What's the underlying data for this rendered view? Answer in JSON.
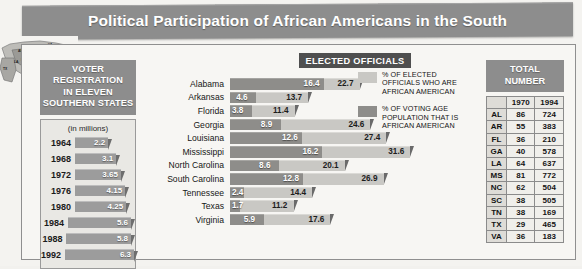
{
  "header": {
    "title": "Political Participation of African Americans in the South"
  },
  "map": {
    "name": "southern-states-map",
    "state_labels": [
      "TX",
      "AR",
      "LA",
      "MS",
      "AL",
      "TN",
      "GA",
      "FL",
      "SC",
      "NC",
      "VA"
    ]
  },
  "voter_registration": {
    "heading_lines": [
      "VOTER",
      "REGISTRATION",
      "IN ELEVEN",
      "SOUTHERN STATES"
    ],
    "subtitle": "(in millions)",
    "rows": [
      {
        "year": "1964",
        "value": "2.2",
        "num": 2.2
      },
      {
        "year": "1968",
        "value": "3.1",
        "num": 3.1
      },
      {
        "year": "1972",
        "value": "3.65",
        "num": 3.65
      },
      {
        "year": "1976",
        "value": "4.15",
        "num": 4.15
      },
      {
        "year": "1980",
        "value": "4.25",
        "num": 4.25
      },
      {
        "year": "1984",
        "value": "5.6",
        "num": 5.6
      },
      {
        "year": "1988",
        "value": "5.8",
        "num": 5.8
      },
      {
        "year": "1992",
        "value": "6.3",
        "num": 6.3
      }
    ]
  },
  "elected_officials": {
    "banner": "ELECTED OFFICIALS",
    "legend": [
      {
        "swatch": "light",
        "text": "% OF ELECTED OFFICIALS WHO ARE AFRICAN AMERICAN"
      },
      {
        "swatch": "dark",
        "text": "% OF VOTING AGE POPULATION THAT IS AFRICAN AMERICAN"
      }
    ]
  },
  "total_number": {
    "heading_lines": [
      "TOTAL",
      "NUMBER"
    ],
    "columns": [
      "",
      "1970",
      "1994"
    ],
    "rows": [
      {
        "state": "AL",
        "y1970": "86",
        "y1994": "724"
      },
      {
        "state": "AR",
        "y1970": "55",
        "y1994": "383"
      },
      {
        "state": "FL",
        "y1970": "36",
        "y1994": "210"
      },
      {
        "state": "GA",
        "y1970": "40",
        "y1994": "578"
      },
      {
        "state": "LA",
        "y1970": "64",
        "y1994": "637"
      },
      {
        "state": "MS",
        "y1970": "81",
        "y1994": "772"
      },
      {
        "state": "NC",
        "y1970": "62",
        "y1994": "504"
      },
      {
        "state": "SC",
        "y1970": "38",
        "y1994": "505"
      },
      {
        "state": "TN",
        "y1970": "38",
        "y1994": "169"
      },
      {
        "state": "TX",
        "y1970": "29",
        "y1994": "465"
      },
      {
        "state": "VA",
        "y1970": "36",
        "y1994": "183"
      }
    ]
  },
  "colors": {
    "banner_gray": "#8d8d8d",
    "bar_light": "#c9c8c4",
    "bar_dark": "#8e8d8a",
    "page_bg": "#f4f3f0",
    "text_dark": "#161616"
  },
  "chart_data": [
    {
      "type": "bar",
      "title": "ELECTED OFFICIALS",
      "orientation": "horizontal",
      "categories": [
        "Alabama",
        "Arkansas",
        "Florida",
        "Georgia",
        "Louisiana",
        "Mississippi",
        "North Carolina",
        "South Carolina",
        "Tennessee",
        "Texas",
        "Virginia"
      ],
      "series": [
        {
          "name": "% OF ELECTED OFFICIALS WHO ARE AFRICAN AMERICAN",
          "values": [
            16.4,
            4.6,
            3.8,
            8.9,
            12.6,
            16.2,
            8.6,
            12.8,
            2.4,
            1.7,
            5.9
          ]
        },
        {
          "name": "% OF VOTING AGE POPULATION THAT IS AFRICAN AMERICAN",
          "values": [
            22.7,
            13.7,
            11.4,
            24.6,
            27.4,
            31.6,
            20.1,
            26.9,
            14.4,
            11.2,
            17.6
          ]
        }
      ],
      "xlabel": "",
      "ylabel": "",
      "xlim": [
        0,
        34
      ],
      "grid": false,
      "legend_position": "right"
    },
    {
      "type": "bar",
      "title": "VOTER REGISTRATION IN ELEVEN SOUTHERN STATES",
      "subtitle": "(in millions)",
      "orientation": "horizontal",
      "categories": [
        "1964",
        "1968",
        "1972",
        "1976",
        "1980",
        "1984",
        "1988",
        "1992"
      ],
      "values": [
        2.2,
        3.1,
        3.65,
        4.15,
        4.25,
        5.6,
        5.8,
        6.3
      ],
      "xlabel": "millions",
      "ylabel": "year",
      "xlim": [
        0,
        7
      ],
      "grid": false
    },
    {
      "type": "table",
      "title": "TOTAL NUMBER",
      "columns": [
        "",
        "1970",
        "1994"
      ],
      "rows": [
        [
          "AL",
          "86",
          "724"
        ],
        [
          "AR",
          "55",
          "383"
        ],
        [
          "FL",
          "36",
          "210"
        ],
        [
          "GA",
          "40",
          "578"
        ],
        [
          "LA",
          "64",
          "637"
        ],
        [
          "MS",
          "81",
          "772"
        ],
        [
          "NC",
          "62",
          "504"
        ],
        [
          "SC",
          "38",
          "505"
        ],
        [
          "TN",
          "38",
          "169"
        ],
        [
          "TX",
          "29",
          "465"
        ],
        [
          "VA",
          "36",
          "183"
        ]
      ]
    }
  ]
}
